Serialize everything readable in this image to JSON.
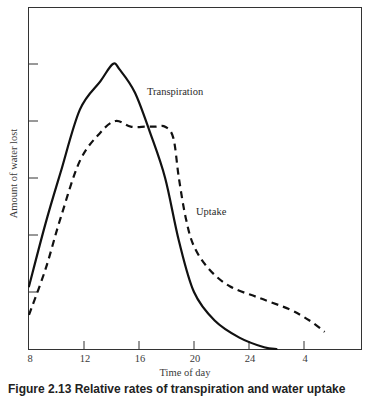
{
  "chart_data": {
    "type": "line",
    "title": "",
    "xlabel": "Time of day",
    "ylabel": "Amount of water lost",
    "x_ticks": [
      "8",
      "12",
      "16",
      "20",
      "24",
      "4"
    ],
    "x_tick_hours": [
      8,
      12,
      16,
      20,
      24,
      28
    ],
    "y_tick_count": 5,
    "y_units": "relative (unlabeled ticks)",
    "xlim": [
      8,
      31
    ],
    "ylim": [
      0,
      6
    ],
    "grid": false,
    "legend": "inline labels",
    "series": [
      {
        "name": "Transpiration",
        "style": "solid",
        "x": [
          8,
          9.2,
          10.3,
          11.7,
          13.2,
          14.1,
          14.6,
          15.7,
          16.8,
          17.9,
          18.9,
          20.0,
          21.5,
          23.3,
          25.1,
          26.0
        ],
        "y": [
          1.1,
          2.2,
          3.1,
          4.2,
          4.7,
          5.0,
          4.9,
          4.5,
          3.8,
          3.0,
          1.9,
          1.0,
          0.5,
          0.2,
          0.03,
          0.0
        ]
      },
      {
        "name": "Uptake",
        "style": "dashed",
        "x": [
          8,
          9.2,
          10.3,
          11.7,
          13.2,
          14.3,
          15.4,
          16.5,
          17.2,
          17.9,
          18.5,
          18.9,
          19.4,
          20.0,
          21.1,
          22.6,
          24.7,
          26.9,
          28.4,
          29.5
        ],
        "y": [
          0.6,
          1.4,
          2.3,
          3.3,
          3.8,
          4.0,
          3.9,
          3.9,
          3.9,
          3.9,
          3.7,
          3.0,
          2.3,
          1.8,
          1.4,
          1.1,
          0.9,
          0.7,
          0.5,
          0.3
        ]
      }
    ],
    "annotations": [
      {
        "text": "Transpiration",
        "near": "peak of solid curve"
      },
      {
        "text": "Uptake",
        "near": "falling dashed curve"
      }
    ]
  },
  "labels": {
    "xlabel": "Time of day",
    "ylabel": "Amount of water lost",
    "transpiration": "Transpiration",
    "uptake": "Uptake",
    "x_ticks": [
      "8",
      "12",
      "16",
      "20",
      "24",
      "4"
    ],
    "caption": "Figure 2.13  Relative rates of transpiration and water uptake"
  },
  "colors": {
    "line": "#111111",
    "axis": "#333333",
    "text": "#2a2a2a",
    "background": "#ffffff"
  }
}
